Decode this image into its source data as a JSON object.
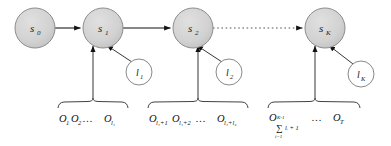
{
  "diagram": {
    "type": "hidden-semi-markov-model-state-diagram",
    "colors": {
      "state_fill": "#d4d4d4",
      "state_stroke": "#888888",
      "duration_fill": "#ffffff",
      "duration_stroke": "#7a7a7a",
      "arrow": "#111111",
      "text": "#111111",
      "background": "#ffffff"
    },
    "states": [
      {
        "id": "s0",
        "base": "s",
        "sub": "0",
        "cx": 35,
        "cy": 28,
        "r": 20
      },
      {
        "id": "s1",
        "base": "s",
        "sub": "1",
        "cx": 103,
        "cy": 28,
        "r": 20
      },
      {
        "id": "s2",
        "base": "s",
        "sub": "2",
        "cx": 193,
        "cy": 28,
        "r": 20
      },
      {
        "id": "sK",
        "base": "s",
        "sub": "K",
        "cx": 325,
        "cy": 28,
        "r": 20
      }
    ],
    "durations": [
      {
        "id": "l1",
        "base": "l",
        "sub": "1",
        "cx": 139,
        "cy": 72,
        "r": 13
      },
      {
        "id": "l2",
        "base": "l",
        "sub": "2",
        "cx": 229,
        "cy": 72,
        "r": 13
      },
      {
        "id": "lK",
        "base": "l",
        "sub": "K",
        "cx": 361,
        "cy": 74,
        "r": 13
      }
    ],
    "transitions": [
      {
        "from": "s0",
        "to": "s1",
        "style": "solid"
      },
      {
        "from": "s1",
        "to": "s2",
        "style": "solid"
      },
      {
        "from": "s2",
        "to": "sK",
        "style": "dotted"
      }
    ],
    "observation_segments": [
      {
        "id": "segment-1",
        "target_state": "s1",
        "brace_x1": 58,
        "brace_x2": 128,
        "brace_y": 103,
        "tokens": [
          {
            "base": "O",
            "sub": "1"
          },
          {
            "base": "O",
            "sub": "2"
          },
          {
            "base": "…",
            "sub": ""
          },
          {
            "base": "O",
            "sub": "l₁"
          }
        ],
        "text": "O₁O₂…O_{l₁}"
      },
      {
        "id": "segment-2",
        "target_state": "s2",
        "brace_x1": 148,
        "brace_x2": 248,
        "brace_y": 103,
        "tokens": [
          {
            "base": "O",
            "sub": "l₁+1"
          },
          {
            "base": "O",
            "sub": "l₁+2"
          },
          {
            "base": "…",
            "sub": ""
          },
          {
            "base": "O",
            "sub": "l₁+l₂"
          }
        ],
        "text": "O_{l₁+1}O_{l₁+2}…O_{l₁+l₂}"
      },
      {
        "id": "segment-3",
        "target_state": "sK",
        "brace_x1": 268,
        "brace_x2": 360,
        "brace_y": 103,
        "tokens": [
          {
            "base": "O",
            "sub": "sum"
          },
          {
            "base": "…",
            "sub": ""
          },
          {
            "base": "O",
            "sub": "T"
          }
        ],
        "summation": {
          "symbol": "∑",
          "lower": "i=1",
          "upper": "K-1",
          "body": "lᵢ + 1"
        },
        "text": "O_{∑_{i=1}^{K-1} lᵢ+1}…O_T"
      }
    ]
  }
}
